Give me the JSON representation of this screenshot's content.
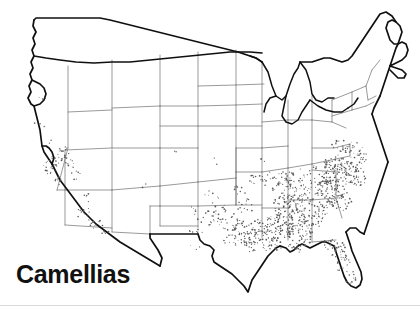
{
  "figure": {
    "caption": "Camellias",
    "subject": "Camellias",
    "map_type": "united-states-distribution-dot-map",
    "background_color": "#ffffff",
    "caption_color": "#111111",
    "dot_color": "#5a5a5a",
    "coastline_color": "#101010",
    "state_border_color": "#6e6e6e",
    "rule_color": "#d9d9d9"
  },
  "chart_data": {
    "type": "map",
    "title": "Camellias",
    "subtitle": "",
    "xlabel": "",
    "ylabel": "",
    "projection": "conterminous-united-states",
    "symbol": "stipple-dot",
    "legend": [],
    "grid": false,
    "regions": [
      {
        "name": "Gulf Coast (LA, MS, AL, FL Panhandle)",
        "density": "very-high",
        "dots": 260
      },
      {
        "name": "South Carolina / Georgia Coastal Plain",
        "density": "very-high",
        "dots": 230
      },
      {
        "name": "North Carolina Coastal Plain",
        "density": "high",
        "dots": 120
      },
      {
        "name": "Florida Peninsula (north & central)",
        "density": "moderate",
        "dots": 70
      },
      {
        "name": "East Texas",
        "density": "moderate",
        "dots": 55
      },
      {
        "name": "Tennessee / Arkansas",
        "density": "low",
        "dots": 40
      },
      {
        "name": "Virginia Coastal Plain",
        "density": "moderate",
        "dots": 45
      },
      {
        "name": "California (coastal & Central Valley)",
        "density": "low",
        "dots": 55
      },
      {
        "name": "Pacific Northwest (WA, OR)",
        "density": "very-low",
        "dots": 8
      },
      {
        "name": "Interior West & Northern Plains",
        "density": "none",
        "dots": 4
      }
    ]
  }
}
